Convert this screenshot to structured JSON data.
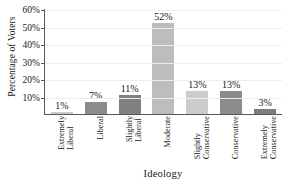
{
  "chart_data": {
    "type": "bar",
    "title": "",
    "xlabel": "Ideology",
    "ylabel": "Percentage of Voters",
    "categories": [
      "Extremely Liberal",
      "Liberal",
      "Slightly Liberal",
      "Moderate",
      "Slightly Conservative",
      "Conservative",
      "Extremely Conservative"
    ],
    "category_lines": [
      [
        "Extremely",
        "Liberal"
      ],
      [
        "Liberal"
      ],
      [
        "Slightly",
        "Liberal"
      ],
      [
        "Moderate"
      ],
      [
        "Slightly",
        "Conservative"
      ],
      [
        "Conservative"
      ],
      [
        "Extremely",
        "Conservative"
      ]
    ],
    "values": [
      1,
      7,
      11,
      52,
      13,
      13,
      3
    ],
    "data_labels": [
      "1%",
      "7%",
      "11%",
      "52%",
      "13%",
      "13%",
      "3%"
    ],
    "bar_colors": [
      "#c9c9c9",
      "#8c8c8c",
      "#808080",
      "#bdbdbd",
      "#cccccc",
      "#8c8c8c",
      "#7d7d7d"
    ],
    "ylim": [
      0,
      60
    ],
    "ytick_values": [
      10,
      20,
      30,
      40,
      50,
      60
    ],
    "ytick_labels": [
      "10%",
      "20%",
      "30%",
      "40%",
      "50%",
      "60%"
    ],
    "grid": true,
    "legend": false,
    "axis_color": "#575757",
    "grid_color": "#ededed",
    "background": "#ffffff"
  }
}
